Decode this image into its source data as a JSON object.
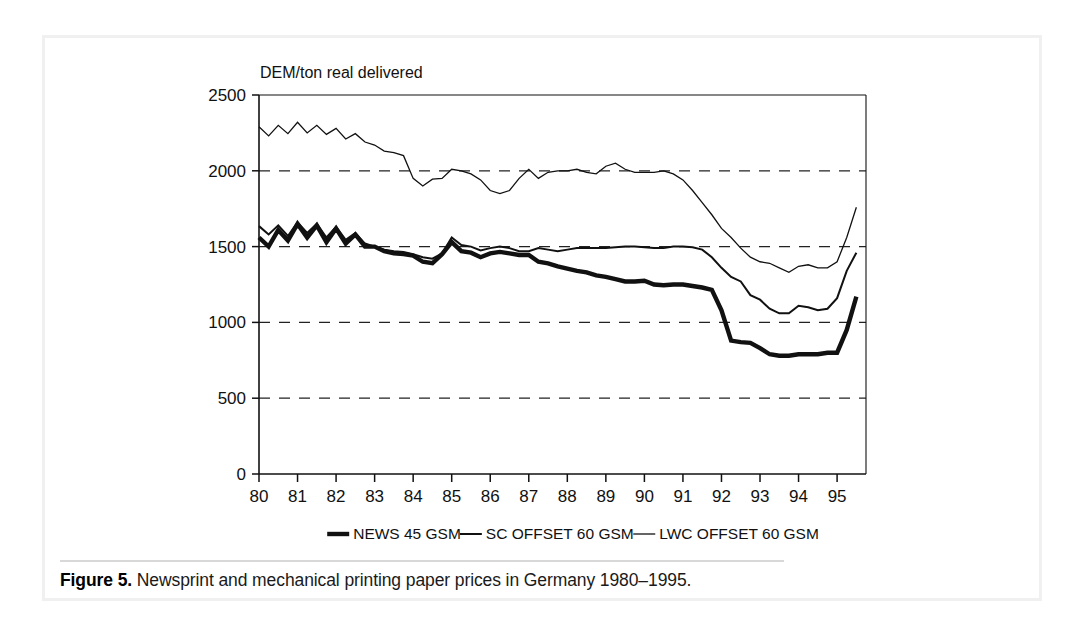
{
  "figure": {
    "caption_label": "Figure 5.",
    "caption_text": "Newsprint and mechanical printing paper prices in Germany 1980–1995."
  },
  "chart_data": {
    "type": "line",
    "title": "",
    "subtitle": "",
    "ylabel": "DEM/ton real delivered",
    "xlabel": "",
    "ylim": [
      0,
      2500
    ],
    "xlim": [
      1980,
      1995.75
    ],
    "yticks": [
      0,
      500,
      1000,
      1500,
      2000,
      2500
    ],
    "ytick_labels": [
      "0",
      "500",
      "1000",
      "1500",
      "2000",
      "2500"
    ],
    "xticks": [
      1980,
      1981,
      1982,
      1983,
      1984,
      1985,
      1986,
      1987,
      1988,
      1989,
      1990,
      1991,
      1992,
      1993,
      1994,
      1995
    ],
    "xtick_labels": [
      "80",
      "81",
      "82",
      "83",
      "84",
      "85",
      "86",
      "87",
      "88",
      "89",
      "90",
      "91",
      "92",
      "93",
      "94",
      "95"
    ],
    "grid": "horizontal-dashed",
    "gridlines": [
      500,
      1000,
      1500,
      2000
    ],
    "legend_position": "bottom",
    "line_color": "#111111",
    "series": [
      {
        "name": "NEWS 45 GSM",
        "style": "thick",
        "width": 4.4,
        "x": [
          1980.0,
          1980.25,
          1980.5,
          1980.75,
          1981.0,
          1981.25,
          1981.5,
          1981.75,
          1982.0,
          1982.25,
          1982.5,
          1982.75,
          1983.0,
          1983.25,
          1983.5,
          1983.75,
          1984.0,
          1984.25,
          1984.5,
          1984.75,
          1985.0,
          1985.25,
          1985.5,
          1985.75,
          1986.0,
          1986.25,
          1986.5,
          1986.75,
          1987.0,
          1987.25,
          1987.5,
          1987.75,
          1988.0,
          1988.25,
          1988.5,
          1988.75,
          1989.0,
          1989.25,
          1989.5,
          1989.75,
          1990.0,
          1990.25,
          1990.5,
          1990.75,
          1991.0,
          1991.25,
          1991.5,
          1991.75,
          1992.0,
          1992.25,
          1992.5,
          1992.75,
          1993.0,
          1993.25,
          1993.5,
          1993.75,
          1994.0,
          1994.25,
          1994.5,
          1994.75,
          1995.0,
          1995.25,
          1995.5
        ],
        "values": [
          1560,
          1500,
          1610,
          1540,
          1650,
          1560,
          1640,
          1530,
          1620,
          1520,
          1580,
          1500,
          1500,
          1470,
          1455,
          1450,
          1440,
          1400,
          1390,
          1450,
          1530,
          1470,
          1460,
          1430,
          1455,
          1465,
          1455,
          1445,
          1445,
          1400,
          1390,
          1370,
          1355,
          1340,
          1330,
          1310,
          1300,
          1285,
          1270,
          1270,
          1275,
          1250,
          1245,
          1250,
          1250,
          1240,
          1230,
          1215,
          1080,
          880,
          870,
          865,
          830,
          790,
          780,
          780,
          790,
          790,
          790,
          800,
          800,
          950,
          1170
        ]
      },
      {
        "name": "SC OFFSET 60 GSM",
        "style": "medium",
        "width": 2.0,
        "x": [
          1980.0,
          1980.25,
          1980.5,
          1980.75,
          1981.0,
          1981.25,
          1981.5,
          1981.75,
          1982.0,
          1982.25,
          1982.5,
          1982.75,
          1983.0,
          1983.25,
          1983.5,
          1983.75,
          1984.0,
          1984.25,
          1984.5,
          1984.75,
          1985.0,
          1985.25,
          1985.5,
          1985.75,
          1986.0,
          1986.25,
          1986.5,
          1986.75,
          1987.0,
          1987.25,
          1987.5,
          1987.75,
          1988.0,
          1988.25,
          1988.5,
          1988.75,
          1989.0,
          1989.25,
          1989.5,
          1989.75,
          1990.0,
          1990.25,
          1990.5,
          1990.75,
          1991.0,
          1991.25,
          1991.5,
          1991.75,
          1992.0,
          1992.25,
          1992.5,
          1992.75,
          1993.0,
          1993.25,
          1993.5,
          1993.75,
          1994.0,
          1994.25,
          1994.5,
          1994.75,
          1995.0,
          1995.25,
          1995.5
        ],
        "values": [
          1635,
          1580,
          1640,
          1570,
          1660,
          1590,
          1650,
          1560,
          1630,
          1545,
          1590,
          1520,
          1500,
          1480,
          1470,
          1465,
          1450,
          1430,
          1420,
          1455,
          1560,
          1510,
          1500,
          1475,
          1490,
          1500,
          1490,
          1470,
          1470,
          1490,
          1480,
          1470,
          1480,
          1490,
          1490,
          1490,
          1490,
          1495,
          1500,
          1500,
          1495,
          1490,
          1490,
          1500,
          1500,
          1495,
          1480,
          1430,
          1360,
          1300,
          1270,
          1180,
          1150,
          1090,
          1060,
          1060,
          1110,
          1100,
          1080,
          1090,
          1160,
          1340,
          1460
        ]
      },
      {
        "name": "LWC OFFSET 60 GSM",
        "style": "thin",
        "width": 1.3,
        "x": [
          1980.0,
          1980.25,
          1980.5,
          1980.75,
          1981.0,
          1981.25,
          1981.5,
          1981.75,
          1982.0,
          1982.25,
          1982.5,
          1982.75,
          1983.0,
          1983.25,
          1983.5,
          1983.75,
          1984.0,
          1984.25,
          1984.5,
          1984.75,
          1985.0,
          1985.25,
          1985.5,
          1985.75,
          1986.0,
          1986.25,
          1986.5,
          1986.75,
          1987.0,
          1987.25,
          1987.5,
          1987.75,
          1988.0,
          1988.25,
          1988.5,
          1988.75,
          1989.0,
          1989.25,
          1989.5,
          1989.75,
          1990.0,
          1990.25,
          1990.5,
          1990.75,
          1991.0,
          1991.25,
          1991.5,
          1991.75,
          1992.0,
          1992.25,
          1992.5,
          1992.75,
          1993.0,
          1993.25,
          1993.5,
          1993.75,
          1994.0,
          1994.25,
          1994.5,
          1994.75,
          1995.0,
          1995.25,
          1995.5
        ],
        "values": [
          2290,
          2230,
          2300,
          2245,
          2320,
          2250,
          2300,
          2240,
          2280,
          2210,
          2245,
          2190,
          2170,
          2130,
          2120,
          2100,
          1950,
          1900,
          1945,
          1950,
          2010,
          2000,
          1980,
          1940,
          1870,
          1850,
          1870,
          1950,
          2010,
          1950,
          1990,
          2000,
          2000,
          2010,
          1990,
          1980,
          2030,
          2050,
          2010,
          1990,
          1990,
          1990,
          2000,
          1980,
          1940,
          1870,
          1790,
          1710,
          1620,
          1560,
          1490,
          1430,
          1400,
          1390,
          1360,
          1330,
          1370,
          1380,
          1360,
          1360,
          1400,
          1560,
          1760
        ]
      }
    ]
  }
}
